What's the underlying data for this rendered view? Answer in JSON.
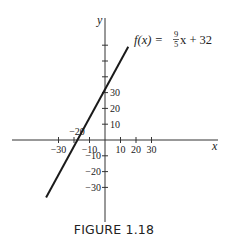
{
  "figure": {
    "caption": "FIGURE 1.18",
    "equation": {
      "lhs": "f(x) = ",
      "frac_num": "9",
      "frac_den": "5",
      "rhs": "x + 32"
    }
  },
  "chart_data": {
    "type": "line",
    "title": "",
    "xlabel": "x",
    "ylabel": "y",
    "xlim": [
      -40,
      40
    ],
    "ylim": [
      -40,
      60
    ],
    "grid": false,
    "x_ticks": [
      -30,
      -20,
      -10,
      10,
      20,
      30
    ],
    "x_tick_labels": [
      "−30",
      "",
      "−10",
      "10",
      "20",
      "30"
    ],
    "y_ticks": [
      -30,
      -20,
      -10,
      10,
      20,
      30,
      40,
      50,
      60
    ],
    "y_tick_labels": [
      "−30",
      "−20",
      "−10",
      "10",
      "20",
      "30",
      "",
      "",
      ""
    ],
    "annotations": [
      {
        "text": "−20",
        "x": -20,
        "y": 0,
        "note": "label above x-axis tick at -20"
      },
      {
        "text": "f(x) = 9/5 x + 32",
        "position": "upper right of line"
      }
    ],
    "series": [
      {
        "name": "f(x) = 9/5 x + 32",
        "function": "9/5*x + 32",
        "x": [
          -38,
          -30,
          -20,
          -17.8,
          -10,
          0,
          10,
          15
        ],
        "values": [
          -36.4,
          -22,
          -4,
          0,
          14,
          32,
          50,
          59
        ]
      }
    ]
  },
  "colors": {
    "line": "#1a1a1a",
    "axis": "#333333",
    "text": "#222222",
    "background": "#ffffff"
  }
}
